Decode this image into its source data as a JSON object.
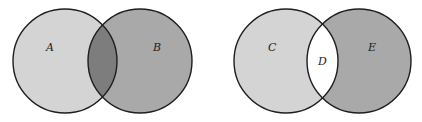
{
  "colors": {
    "background": "#ffffff",
    "light_fill": "#d4d4d4",
    "medium_fill": "#a9a9a9",
    "intersection_dark": "#7d7d7d",
    "intersection_white": "#ffffff",
    "stroke": "#1e1e1e"
  },
  "diagrams": [
    {
      "name": "intersection-diagram",
      "sets": [
        {
          "label": "A",
          "cx": 65,
          "cy": 61,
          "r": 52
        },
        {
          "label": "B",
          "cx": 140,
          "cy": 61,
          "r": 52
        }
      ],
      "shaded_region": "intersection"
    },
    {
      "name": "symmetric-difference-diagram",
      "sets": [
        {
          "label": "C",
          "cx": 286,
          "cy": 61,
          "r": 52
        },
        {
          "label": "E",
          "cx": 359,
          "cy": 61,
          "r": 52
        }
      ],
      "intersection_label": "D",
      "shaded_region": "none-in-intersection"
    }
  ]
}
